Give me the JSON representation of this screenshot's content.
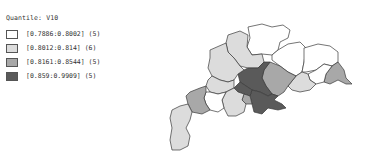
{
  "legend": {
    "title": "Quantile: V10",
    "classes": [
      {
        "label": "[0.7886:0.8002] (5)",
        "color": "#ffffff"
      },
      {
        "label": "[0.8012:0.814] (6)",
        "color": "#dcdcdc"
      },
      {
        "label": "[0.8161:0.8544] (5)",
        "color": "#a8a8a8"
      },
      {
        "label": "[0.859:0.9909] (5)",
        "color": "#5a5a5a"
      }
    ]
  }
}
